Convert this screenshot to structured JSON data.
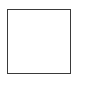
{
  "shape": {
    "type": "square-outline",
    "border_color": "#3a3a3a",
    "fill_color": "#ffffff"
  }
}
